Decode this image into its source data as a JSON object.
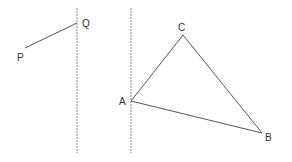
{
  "diagram": {
    "colors": {
      "background": "#ffffff",
      "line": "#555555",
      "dashed": "#888888",
      "label": "#333333"
    },
    "mirror_lines": [
      {
        "name": "left-mirror-line",
        "x": 77,
        "y1": 8,
        "y2": 153
      },
      {
        "name": "right-mirror-line",
        "x": 131,
        "y1": 8,
        "y2": 153
      }
    ],
    "points": {
      "P": {
        "label": "P",
        "x": 25,
        "y": 48
      },
      "Q": {
        "label": "Q",
        "x": 77,
        "y": 23
      },
      "A": {
        "label": "A",
        "x": 131,
        "y": 101
      },
      "B": {
        "label": "B",
        "x": 262,
        "y": 133
      },
      "C": {
        "label": "C",
        "x": 183,
        "y": 35
      }
    },
    "segments": [
      {
        "from": "P",
        "to": "Q"
      },
      {
        "from": "A",
        "to": "C"
      },
      {
        "from": "C",
        "to": "B"
      },
      {
        "from": "A",
        "to": "B"
      }
    ]
  }
}
